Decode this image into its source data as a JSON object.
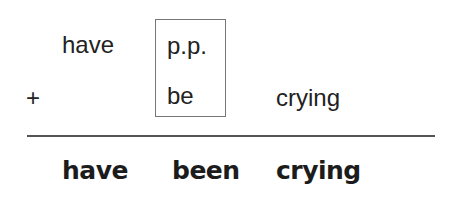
{
  "diagram": {
    "rows": {
      "row1": {
        "have": "have",
        "pp": "p.p."
      },
      "row2": {
        "plus": "+",
        "be": "be",
        "crying": "crying"
      }
    },
    "result": {
      "w1": "have",
      "w2": "been",
      "w3": "crying"
    },
    "colors": {
      "text": "#222222",
      "box_border": "#777777",
      "rule": "#555555"
    }
  }
}
